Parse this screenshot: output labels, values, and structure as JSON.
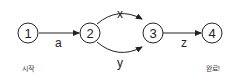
{
  "diagram": {
    "type": "state-transition-graph",
    "nodes": [
      {
        "id": "1",
        "label": "1",
        "caption": "시작"
      },
      {
        "id": "2",
        "label": "2"
      },
      {
        "id": "3",
        "label": "3"
      },
      {
        "id": "4",
        "label": "4",
        "caption": "완료!"
      }
    ],
    "edges": [
      {
        "from": "1",
        "to": "2",
        "label": "a"
      },
      {
        "from": "2",
        "to": "3",
        "label": "x"
      },
      {
        "from": "2",
        "to": "3",
        "label": "y"
      },
      {
        "from": "3",
        "to": "4",
        "label": "z"
      }
    ],
    "colors": {
      "stroke": "#222222",
      "background": "#ffffff"
    }
  }
}
